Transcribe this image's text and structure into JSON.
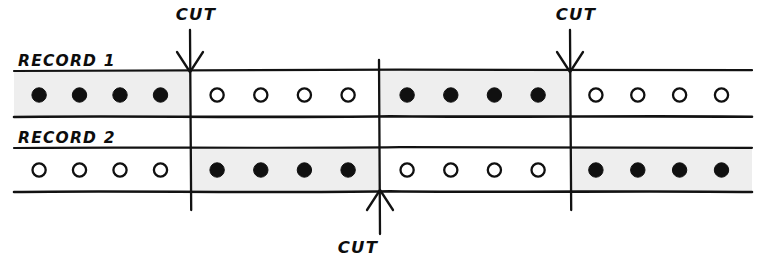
{
  "diagram": {
    "records": [
      {
        "id": "record-1",
        "label": "RECORD 1",
        "blocks": [
          {
            "index": 0,
            "state": "filled",
            "shaded": true,
            "count": 4
          },
          {
            "index": 1,
            "state": "open",
            "shaded": false,
            "count": 4
          },
          {
            "index": 2,
            "state": "filled",
            "shaded": true,
            "count": 4
          },
          {
            "index": 3,
            "state": "open",
            "shaded": false,
            "count": 4
          }
        ],
        "dot_pattern": [
          "filled",
          "filled",
          "filled",
          "filled",
          "open",
          "open",
          "open",
          "open",
          "filled",
          "filled",
          "filled",
          "filled",
          "open",
          "open",
          "open",
          "open"
        ]
      },
      {
        "id": "record-2",
        "label": "RECORD 2",
        "blocks": [
          {
            "index": 0,
            "state": "open",
            "shaded": false,
            "count": 4
          },
          {
            "index": 1,
            "state": "filled",
            "shaded": true,
            "count": 4
          },
          {
            "index": 2,
            "state": "open",
            "shaded": false,
            "count": 4
          },
          {
            "index": 3,
            "state": "filled",
            "shaded": true,
            "count": 4
          }
        ],
        "dot_pattern": [
          "open",
          "open",
          "open",
          "open",
          "filled",
          "filled",
          "filled",
          "filled",
          "open",
          "open",
          "open",
          "open",
          "filled",
          "filled",
          "filled",
          "filled"
        ]
      }
    ],
    "cuts": [
      {
        "id": "cut-1",
        "label": "CUT",
        "x": 190,
        "direction": "down",
        "label_x": 196,
        "label_y": 20
      },
      {
        "id": "cut-2",
        "label": "CUT",
        "x": 380,
        "direction": "up",
        "label_x": 358,
        "label_y": 253
      },
      {
        "id": "cut-3",
        "label": "CUT",
        "x": 570,
        "direction": "down",
        "label_x": 576,
        "label_y": 20
      }
    ],
    "colors": {
      "ink": "#121212",
      "shade": "#eeeeee",
      "background": "#ffffff",
      "dot_fill": "#101010"
    }
  }
}
